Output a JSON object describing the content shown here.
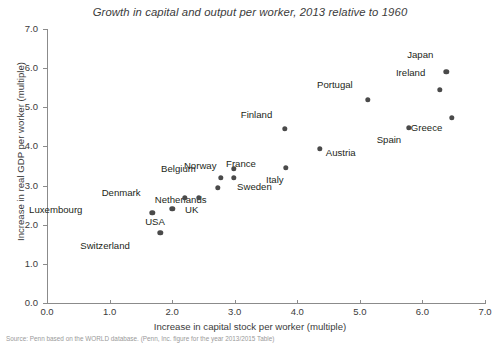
{
  "chart_data": {
    "type": "scatter",
    "title": "Growth in capital and output per worker, 2013 relative to 1960",
    "xlabel": "Increase in capital stock per worker (multiple)",
    "ylabel": "Increase in real GDP per worker (multiple)",
    "xlim": [
      0.0,
      7.0
    ],
    "ylim": [
      0.0,
      7.0
    ],
    "xticks": [
      "0.0",
      "1.0",
      "2.0",
      "3.0",
      "4.0",
      "5.0",
      "6.0",
      "7.0"
    ],
    "yticks": [
      "0.0",
      "1.0",
      "2.0",
      "3.0",
      "4.0",
      "5.0",
      "6.0",
      "7.0"
    ],
    "grid": false,
    "legend": "none",
    "marker_color": "#4a4a4a",
    "points": [
      {
        "label": "Japan",
        "x": 6.38,
        "y": 5.91,
        "lx": -19,
        "ly": -17
      },
      {
        "label": "Ireland",
        "x": 6.28,
        "y": 5.45,
        "lx": -21,
        "ly": -17
      },
      {
        "label": "Greece",
        "x": 6.47,
        "y": 4.73,
        "lx": -16,
        "ly": 10
      },
      {
        "label": "Spain",
        "x": 5.78,
        "y": 4.48,
        "lx": -13,
        "ly": 12
      },
      {
        "label": "Portugal",
        "x": 5.13,
        "y": 5.19,
        "lx": -21,
        "ly": -15
      },
      {
        "label": "Austria",
        "x": 4.36,
        "y": 3.94,
        "lx": 6,
        "ly": 4
      },
      {
        "label": "Finland",
        "x": 3.8,
        "y": 4.45,
        "lx": -19,
        "ly": -14
      },
      {
        "label": "France",
        "x": 3.82,
        "y": 3.45,
        "lx": -36,
        "ly": -4
      },
      {
        "label": "Italy",
        "x": 3.82,
        "y": 3.45,
        "lx": -8,
        "ly": 12
      },
      {
        "label": "Belgium",
        "x": 2.99,
        "y": 3.43,
        "lx": -44,
        "ly": 0
      },
      {
        "label": "Norway",
        "x": 2.78,
        "y": 3.2,
        "lx": -10,
        "ly": -12
      },
      {
        "label": "Sweden",
        "x": 2.99,
        "y": 3.2,
        "lx": 3,
        "ly": 9
      },
      {
        "label": "Netherlands",
        "x": 2.73,
        "y": 2.94,
        "lx": -17,
        "ly": 12
      },
      {
        "label": "Denmark",
        "x": 2.2,
        "y": 2.69,
        "lx": -50,
        "ly": -5
      },
      {
        "label": "UK",
        "x": 2.43,
        "y": 2.69,
        "lx": -7,
        "ly": 12
      },
      {
        "label": "Luxembourg",
        "x": 1.68,
        "y": 2.3,
        "lx": -76,
        "ly": -3
      },
      {
        "label": "USA",
        "x": 2.0,
        "y": 2.4,
        "lx": -13,
        "ly": 13
      },
      {
        "label": "Switzerland",
        "x": 1.81,
        "y": 1.79,
        "lx": -36,
        "ly": 13
      }
    ]
  },
  "source": {
    "text": "Source: Penn based on the WORLD database. (Penn, Inc. figure for the year 2013/2015 Table)"
  }
}
